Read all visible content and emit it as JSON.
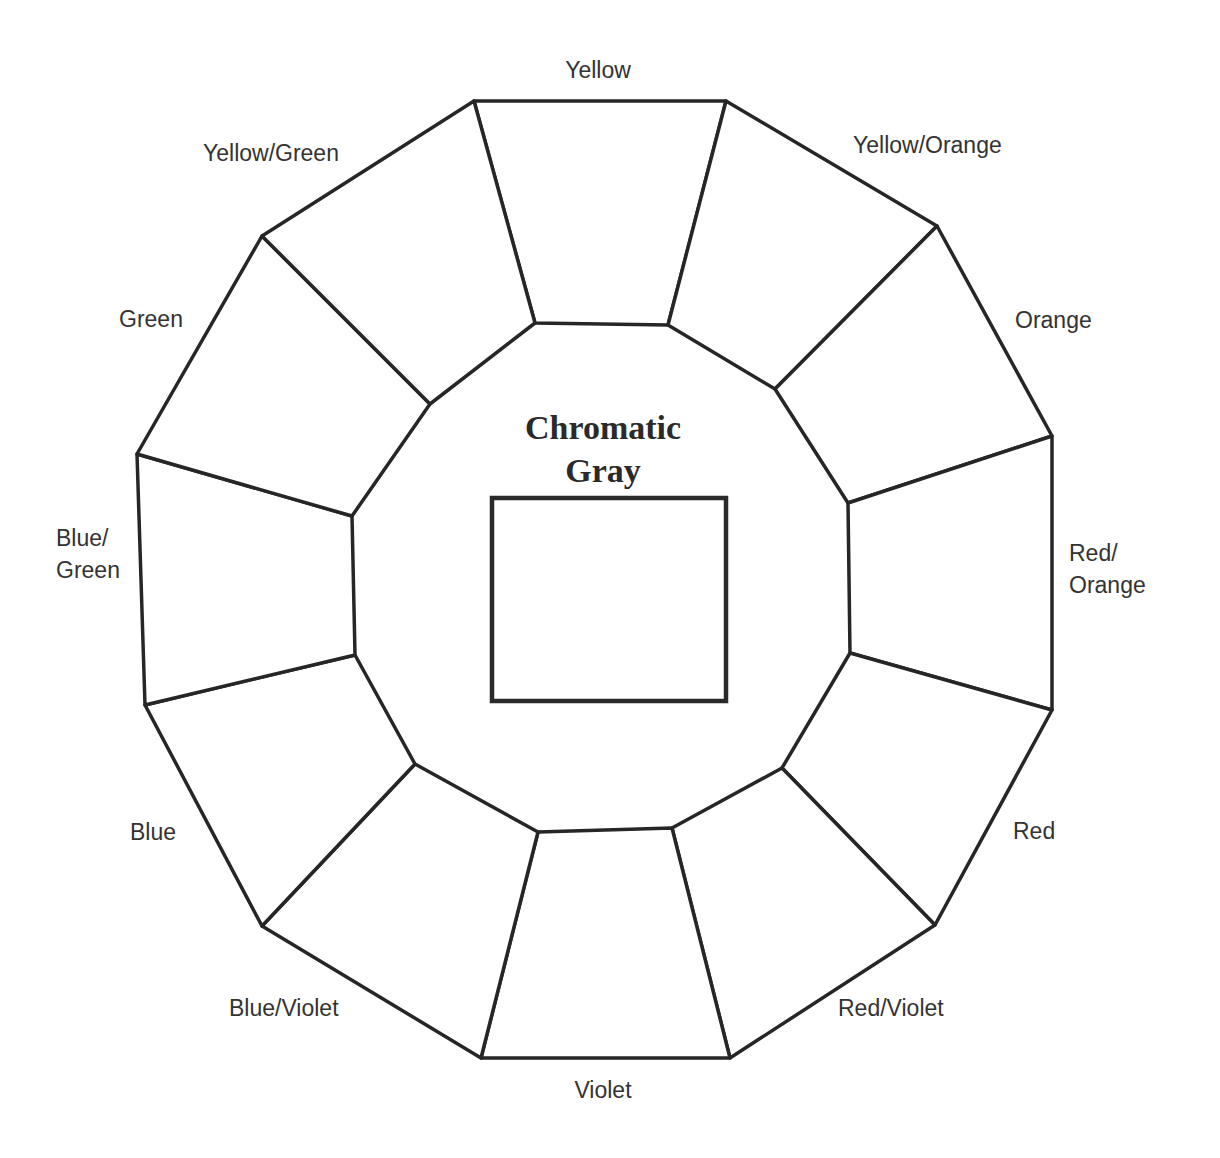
{
  "diagram": {
    "title_line1": "Chromatic",
    "title_line2": "Gray",
    "center_box": "empty swatch",
    "segments": [
      {
        "label": "Yellow",
        "lines": [
          "Yellow"
        ]
      },
      {
        "label": "Yellow/Orange",
        "lines": [
          "Yellow/Orange"
        ]
      },
      {
        "label": "Orange",
        "lines": [
          "Orange"
        ]
      },
      {
        "label": "Red/Orange",
        "lines": [
          "Red/",
          "Orange"
        ]
      },
      {
        "label": "Red",
        "lines": [
          "Red"
        ]
      },
      {
        "label": "Red/Violet",
        "lines": [
          "Red/Violet"
        ]
      },
      {
        "label": "Violet",
        "lines": [
          "Violet"
        ]
      },
      {
        "label": "Blue/Violet",
        "lines": [
          "Blue/Violet"
        ]
      },
      {
        "label": "Blue",
        "lines": [
          "Blue"
        ]
      },
      {
        "label": "Blue/Green",
        "lines": [
          "Blue/",
          "Green"
        ]
      },
      {
        "label": "Green",
        "lines": [
          "Green"
        ]
      },
      {
        "label": "Yellow/Green",
        "lines": [
          "Yellow/Green"
        ]
      }
    ],
    "colors": {
      "stroke": "#262626",
      "text": "#333333",
      "background": "#ffffff"
    }
  }
}
